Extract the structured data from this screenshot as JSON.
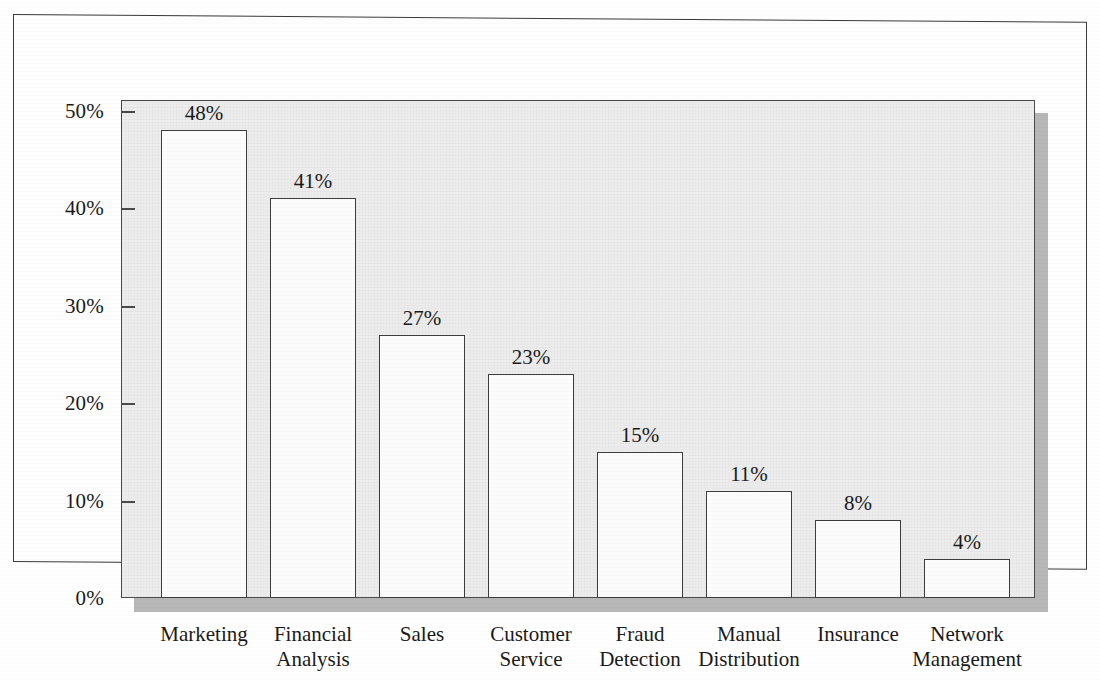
{
  "chart_data": {
    "type": "bar",
    "title": "",
    "subtitle": "",
    "xlabel": "",
    "ylabel": "",
    "categories": [
      "Marketing",
      "Financial\nAnalysis",
      "Sales",
      "Customer\nService",
      "Fraud\nDetection",
      "Manual\nDistribution",
      "Insurance",
      "Network\nManagement"
    ],
    "values": [
      48,
      41,
      27,
      23,
      15,
      11,
      8,
      4
    ],
    "value_labels": [
      "48%",
      "41%",
      "27%",
      "23%",
      "15%",
      "11%",
      "8%",
      "4%"
    ],
    "ylim": [
      0,
      52.5
    ],
    "yticks": [
      0,
      10,
      20,
      30,
      40,
      50
    ],
    "ytick_labels": [
      "0%",
      "10%",
      "20%",
      "30%",
      "40%",
      "50%"
    ],
    "grid": false,
    "legend": null,
    "legend_position": "none",
    "colors": {
      "bar_fill": "#fbfbfb",
      "bar_edge": "#3d3d3d",
      "plot_background": "#ededed",
      "plot_edge": "#4a4a4a",
      "shadow": "#b7b7b7",
      "frame_edge": "#3a3a3a",
      "text": "#1a1a1a",
      "page_background": "#ffffff"
    }
  }
}
